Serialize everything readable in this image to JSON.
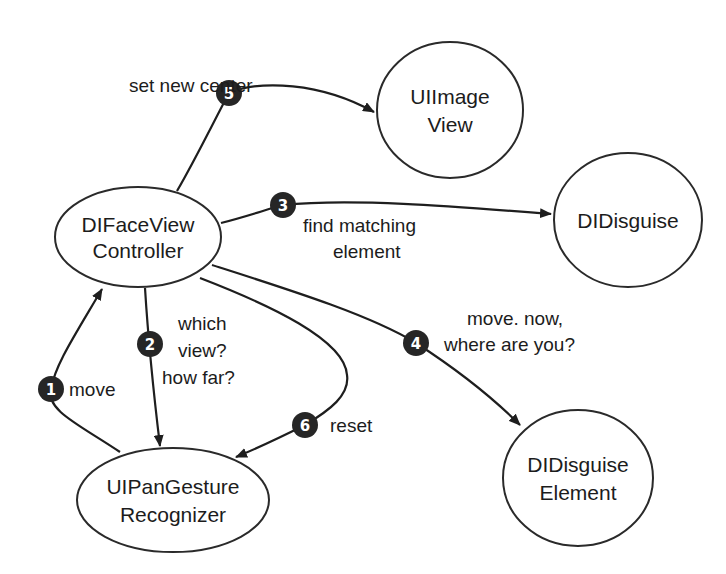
{
  "nodes": {
    "face_controller": {
      "lines": [
        "DIFaceView",
        "Controller"
      ]
    },
    "image_view": {
      "lines": [
        "UIImage",
        "View"
      ]
    },
    "disguise": {
      "lines": [
        "DIDisguise"
      ]
    },
    "disguise_element": {
      "lines": [
        "DIDisguise",
        "Element"
      ]
    },
    "pan_gesture": {
      "lines": [
        "UIPanGesture",
        "Recognizer"
      ]
    }
  },
  "edges": [
    {
      "step": "1",
      "from": "UIPanGestureRecognizer",
      "to": "DIFaceViewController",
      "label": [
        "move"
      ]
    },
    {
      "step": "2",
      "from": "DIFaceViewController",
      "to": "UIPanGestureRecognizer",
      "label": [
        "which",
        "view?",
        "how far?"
      ]
    },
    {
      "step": "3",
      "from": "DIFaceViewController",
      "to": "DIDisguise",
      "label": [
        "find matching",
        "element"
      ]
    },
    {
      "step": "4",
      "from": "DIFaceViewController",
      "to": "DIDisguiseElement",
      "label": [
        "move. now,",
        "where are you?"
      ]
    },
    {
      "step": "5",
      "from": "DIFaceViewController",
      "to": "UIImageView",
      "label": [
        "set new center"
      ]
    },
    {
      "step": "6",
      "from": "DIFaceViewController",
      "to": "UIPanGestureRecognizer",
      "label": [
        "reset"
      ]
    }
  ],
  "colors": {
    "ink": "#1e1e1e",
    "badge": "#262626",
    "background": "#ffffff"
  }
}
